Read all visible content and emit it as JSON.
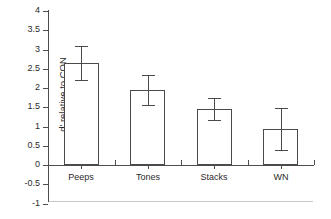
{
  "chart_data": {
    "type": "bar",
    "title": "",
    "xlabel": "",
    "ylabel": "d' relative to CON",
    "categories": [
      "Peeps",
      "Tones",
      "Stacks",
      "WN"
    ],
    "values": [
      2.65,
      1.95,
      1.45,
      0.93
    ],
    "errors": [
      0.45,
      0.4,
      0.28,
      0.55
    ],
    "series": [
      {
        "name": "d' relative to CON",
        "values": [
          2.65,
          1.95,
          1.45,
          0.93
        ],
        "errors": [
          0.45,
          0.4,
          0.28,
          0.55
        ]
      }
    ],
    "ylim": [
      -1,
      4
    ],
    "ytick_labels": [
      "4",
      "3.5",
      "3",
      "2.5",
      "2",
      "1.5",
      "1",
      "0.5",
      "0",
      "-0.5",
      "-1"
    ],
    "ytick_values": [
      4,
      3.5,
      3,
      2.5,
      2,
      1.5,
      1,
      0.5,
      0,
      -0.5,
      -1
    ],
    "grid": false,
    "legend": false,
    "bar_fill_color": "#ffffff",
    "bar_edge_color": "#4a4a4a",
    "axis_color": "#4d4d4d",
    "baseline_rule_color": "#c9c9c9"
  }
}
